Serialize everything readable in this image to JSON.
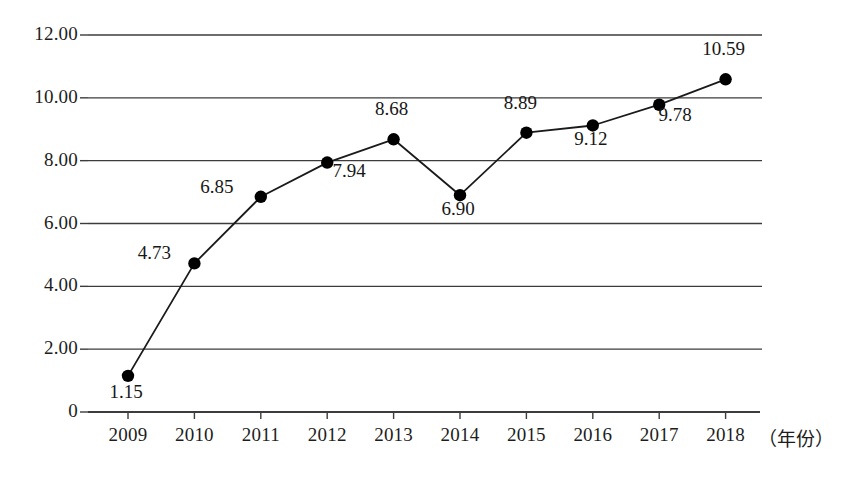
{
  "chart_data": {
    "type": "line",
    "title": "",
    "subtitle": "",
    "xlabel": "（年份）",
    "ylabel": "",
    "categories": [
      "2009",
      "2010",
      "2011",
      "2012",
      "2013",
      "2014",
      "2015",
      "2016",
      "2017",
      "2018"
    ],
    "values": [
      1.15,
      4.73,
      6.85,
      7.94,
      8.68,
      6.9,
      8.89,
      9.12,
      9.78,
      10.59
    ],
    "point_labels": [
      "1.15",
      "4.73",
      "6.85",
      "7.94",
      "8.68",
      "6.90",
      "8.89",
      "9.12",
      "9.78",
      "10.59"
    ],
    "ylim": [
      0,
      12
    ],
    "ytick_labels": [
      "12.00",
      "10.00",
      "8.00",
      "6.00",
      "4.00",
      "2.00",
      "0"
    ],
    "ytick_values": [
      12,
      10,
      8,
      6,
      4,
      2,
      0
    ],
    "grid": true,
    "legend": null,
    "legend_position": "none",
    "series": [
      {
        "name": "",
        "values": [
          1.15,
          4.73,
          6.85,
          7.94,
          8.68,
          6.9,
          8.89,
          9.12,
          9.78,
          10.59
        ]
      }
    ],
    "marker": "filled-circle",
    "line_color": "#1a1a1a",
    "marker_color": "#000000",
    "grid_color": "#3c3c3c",
    "background_color": "#ffffff"
  },
  "label_offsets": [
    {
      "dx": -2,
      "dy": 18
    },
    {
      "dx": -36,
      "dy": -10
    },
    {
      "dx": -40,
      "dy": -9
    },
    {
      "dx": 20,
      "dy": 13
    },
    {
      "dx": -2,
      "dy": -28
    },
    {
      "dx": -2,
      "dy": 16
    },
    {
      "dx": -8,
      "dy": -28
    },
    {
      "dx": -2,
      "dy": 17
    },
    {
      "dx": 12,
      "dy": 14
    }
  ],
  "geometry": {
    "plot_left": 88,
    "plot_right": 762,
    "axis_y": 412,
    "top_gridline_y": 35,
    "x_first": 128,
    "x_step": 66.4
  }
}
